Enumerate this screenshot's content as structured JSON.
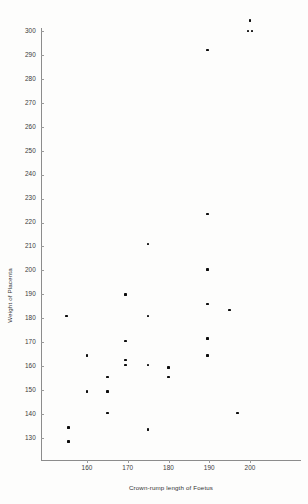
{
  "chart_data": {
    "type": "scatter",
    "title": "",
    "xlabel": "Crown-rump length of Foetus",
    "ylabel": "Weight of Placenta",
    "xlim": [
      151,
      205
    ],
    "ylim": [
      126,
      306
    ],
    "xticks": [
      160,
      170,
      180,
      190,
      200
    ],
    "yticks": [
      130,
      140,
      150,
      160,
      170,
      180,
      190,
      200,
      210,
      220,
      230,
      240,
      250,
      260,
      270,
      280,
      290,
      300
    ],
    "grid": false,
    "legend": null,
    "marker": "square",
    "marker_color": "#0d0d0d",
    "points": [
      {
        "x": 155.0,
        "y": 181.0
      },
      {
        "x": 155.5,
        "y": 134.5
      },
      {
        "x": 155.5,
        "y": 128.5
      },
      {
        "x": 160.0,
        "y": 164.5
      },
      {
        "x": 160.0,
        "y": 149.5
      },
      {
        "x": 165.0,
        "y": 155.5
      },
      {
        "x": 165.0,
        "y": 149.5
      },
      {
        "x": 165.0,
        "y": 140.5
      },
      {
        "x": 169.5,
        "y": 190.0
      },
      {
        "x": 169.5,
        "y": 170.5
      },
      {
        "x": 169.5,
        "y": 162.5
      },
      {
        "x": 169.5,
        "y": 160.5
      },
      {
        "x": 175.0,
        "y": 211.0
      },
      {
        "x": 175.0,
        "y": 181.0
      },
      {
        "x": 175.0,
        "y": 160.5
      },
      {
        "x": 175.0,
        "y": 133.5
      },
      {
        "x": 180.0,
        "y": 159.5
      },
      {
        "x": 180.0,
        "y": 155.5
      },
      {
        "x": 189.5,
        "y": 292.0
      },
      {
        "x": 189.5,
        "y": 223.5
      },
      {
        "x": 189.5,
        "y": 200.5
      },
      {
        "x": 189.5,
        "y": 186.0
      },
      {
        "x": 189.5,
        "y": 171.5
      },
      {
        "x": 189.5,
        "y": 164.5
      },
      {
        "x": 195.0,
        "y": 183.5
      },
      {
        "x": 197.0,
        "y": 140.5
      },
      {
        "x": 199.5,
        "y": 300.0
      },
      {
        "x": 200.5,
        "y": 300.0
      },
      {
        "x": 200.0,
        "y": 304.5
      }
    ]
  },
  "axes": {
    "x_title": "Crown-rump length of Foetus",
    "y_title": "Weight of Placenta",
    "x_tick_labels": [
      "160",
      "170",
      "180",
      "190",
      "200"
    ],
    "y_tick_labels": [
      "300",
      "290",
      "280",
      "270",
      "260",
      "250",
      "240",
      "230",
      "220",
      "210",
      "200",
      "190",
      "180",
      "170",
      "160",
      "150",
      "140",
      "130"
    ]
  }
}
